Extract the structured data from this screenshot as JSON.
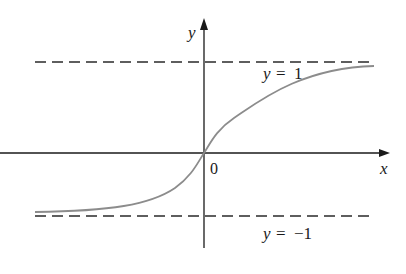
{
  "figure": {
    "type": "function-graph",
    "axes": {
      "x_label": "x",
      "y_label": "y",
      "origin_label": "0"
    },
    "asymptotes": [
      {
        "label_var": "y",
        "label_eq": "=",
        "label_val": "1",
        "value": 1
      },
      {
        "label_var": "y",
        "label_eq": "=",
        "label_val": "−1",
        "value": -1
      }
    ],
    "colors": {
      "axis": "#1a1a1a",
      "dash": "#2a2a2a",
      "curve": "#8c8c8c"
    }
  }
}
